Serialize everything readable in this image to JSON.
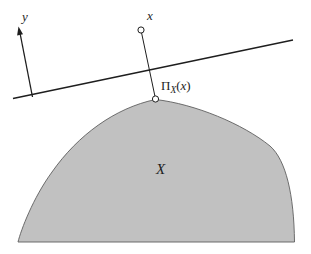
{
  "figure": {
    "background": "#ffffff",
    "colors": {
      "line": "#1e1e1e",
      "set_fill": "#c1c1c1",
      "set_stroke": "#5f5f5f",
      "marker_fill": "#ffffff",
      "marker_stroke": "#1e1e1e",
      "text": "#1e1e1e"
    },
    "labels": {
      "y_axis": "y",
      "point_x": "x",
      "set": "X",
      "projection": {
        "pi": "Π",
        "sub": "X",
        "open": "(",
        "arg": "x",
        "close": ")"
      }
    },
    "geometry": {
      "canvas": {
        "width": "311",
        "height": "254",
        "viewbox": "0 0 311 254"
      },
      "set_path": {
        "d": "M 155.5 99.5 C 195 104 243 124 270 146 C 286 160 294 195 294.5 242 L 18 242 C 21 230 33 198 52 172 C 78 135 115 108 155.5 99.5 Z"
      },
      "hyperplane": {
        "x1": "13",
        "y1": "98.5",
        "x2": "293",
        "y2": "40"
      },
      "y_axis_line": {
        "x1": "32.5",
        "y1": "97",
        "x2": "19.6",
        "y2": "31"
      },
      "y_axis_arrowhead": {
        "points": "18.5,26.5 23.0,34.3 17.1,35.4"
      },
      "projection_segment": {
        "x1": "141.6",
        "y1": "33",
        "x2": "154.9",
        "y2": "96"
      },
      "point_x_marker": {
        "cx": "141",
        "cy": "30",
        "r": "3.1"
      },
      "projection_marker": {
        "cx": "155.5",
        "cy": "99",
        "r": "3.1"
      }
    }
  }
}
